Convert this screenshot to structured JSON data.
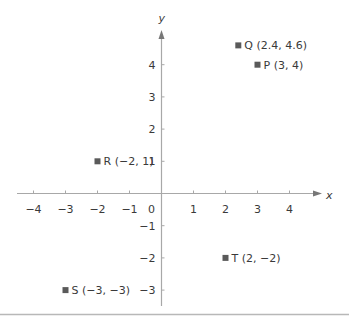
{
  "chart_data": {
    "type": "scatter",
    "title": "",
    "xlabel": "x",
    "ylabel": "y",
    "xlim": [
      -4.5,
      5
    ],
    "ylim": [
      -3.5,
      5
    ],
    "grid": false,
    "x_ticks": [
      -4,
      -3,
      -2,
      -1,
      1,
      2,
      3,
      4
    ],
    "y_ticks": [
      4,
      3,
      2,
      1,
      -1,
      -2,
      -3
    ],
    "x_tick_labels": [
      "−4",
      "−3",
      "−2",
      "−1",
      "1",
      "2",
      "3",
      "4"
    ],
    "y_tick_labels": [
      "4",
      "3",
      "2",
      "1",
      "−1",
      "−2",
      "−3"
    ],
    "origin_label": "0",
    "points": [
      {
        "name": "Q",
        "x": 2.4,
        "y": 4.6,
        "label": "Q (2.4, 4.6)"
      },
      {
        "name": "P",
        "x": 3,
        "y": 4,
        "label": "P (3, 4)"
      },
      {
        "name": "R",
        "x": -2,
        "y": 1,
        "label": "R (−2, 1)"
      },
      {
        "name": "T",
        "x": 2,
        "y": -2,
        "label": "T (2, −2)"
      },
      {
        "name": "S",
        "x": -3,
        "y": -3,
        "label": "S (−3, −3)"
      }
    ]
  },
  "colors": {
    "axis": "#a8a8a8",
    "text": "#3a3a3a",
    "marker": "#5a5a5a",
    "rule": "#b8b8b8"
  }
}
